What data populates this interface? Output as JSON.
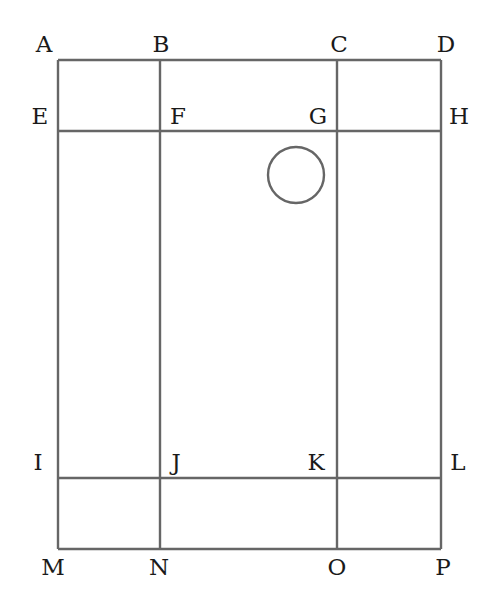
{
  "diagram": {
    "line_color": "#666666",
    "label_color": "#1a1a1a",
    "points": {
      "A": {
        "label": "A",
        "x": 58,
        "y": 60
      },
      "B": {
        "label": "B",
        "x": 160,
        "y": 60
      },
      "C": {
        "label": "C",
        "x": 337,
        "y": 60
      },
      "D": {
        "label": "D",
        "x": 441,
        "y": 60
      },
      "E": {
        "label": "E",
        "x": 58,
        "y": 131
      },
      "F": {
        "label": "F",
        "x": 160,
        "y": 131
      },
      "G": {
        "label": "G",
        "x": 337,
        "y": 131
      },
      "H": {
        "label": "H",
        "x": 441,
        "y": 131
      },
      "I": {
        "label": "I",
        "x": 58,
        "y": 478
      },
      "J": {
        "label": "J",
        "x": 160,
        "y": 478
      },
      "K": {
        "label": "K",
        "x": 337,
        "y": 478
      },
      "L": {
        "label": "L",
        "x": 441,
        "y": 478
      },
      "M": {
        "label": "M",
        "x": 58,
        "y": 549
      },
      "N": {
        "label": "N",
        "x": 160,
        "y": 549
      },
      "O": {
        "label": "O",
        "x": 337,
        "y": 549
      },
      "P": {
        "label": "P",
        "x": 441,
        "y": 549
      }
    },
    "segments": [
      {
        "from": "A",
        "to": "D"
      },
      {
        "from": "E",
        "to": "H"
      },
      {
        "from": "I",
        "to": "L"
      },
      {
        "from": "M",
        "to": "P"
      },
      {
        "from": "A",
        "to": "M"
      },
      {
        "from": "B",
        "to": "N"
      },
      {
        "from": "C",
        "to": "O"
      },
      {
        "from": "D",
        "to": "P"
      }
    ],
    "circle": {
      "cx": 296,
      "cy": 175,
      "r": 28
    }
  }
}
